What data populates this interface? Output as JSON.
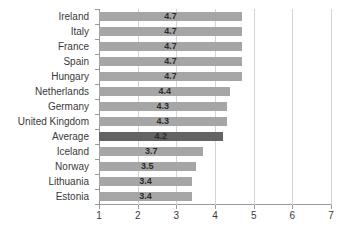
{
  "chart_data": {
    "type": "bar",
    "orientation": "horizontal",
    "title": "",
    "subtitle": "",
    "xlabel": "",
    "ylabel": "",
    "xlim": [
      1,
      7
    ],
    "xticks": [
      "1",
      "2",
      "3",
      "4",
      "5",
      "6",
      "7"
    ],
    "grid": true,
    "legend": "none",
    "categories": [
      "Ireland",
      "Italy",
      "France",
      "Spain",
      "Hungary",
      "Netherlands",
      "Germany",
      "United Kingdom",
      "Average",
      "Iceland",
      "Norway",
      "Lithuania",
      "Estonia"
    ],
    "values": [
      4.7,
      4.7,
      4.7,
      4.7,
      4.7,
      4.4,
      4.3,
      4.3,
      4.2,
      3.7,
      3.5,
      3.4,
      3.4
    ],
    "value_labels": [
      "4.7",
      "4.7",
      "4.7",
      "4.7",
      "4.7",
      "4.4",
      "4.3",
      "4.3",
      "4.2",
      "3.7",
      "3.5",
      "3.4",
      "3.4"
    ],
    "highlight_category": "Average",
    "highlight_index": 8,
    "colors": {
      "bar": "#a6a6a6",
      "bar_highlight": "#636363",
      "gridline": "#d4d4d4",
      "axis": "#9a9a9a",
      "text": "#3a3a3a",
      "value_text": "#2b2b2b",
      "background": "#ffffff"
    }
  }
}
